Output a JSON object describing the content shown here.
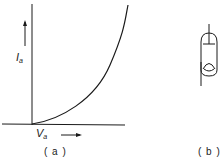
{
  "figure_a": {
    "caption": "( a )",
    "y_axis": {
      "symbol": "I",
      "subscript": "a"
    },
    "x_axis": {
      "symbol": "V",
      "subscript": "a"
    },
    "curve": "anode current rises nonlinearly (approx. power-law) with anode voltage, starting at origin"
  },
  "figure_b": {
    "caption": "( b )",
    "symbol": "vacuum-tube-diode"
  },
  "colors": {
    "ink": "#1a1a1a",
    "background": "#ffffff"
  }
}
